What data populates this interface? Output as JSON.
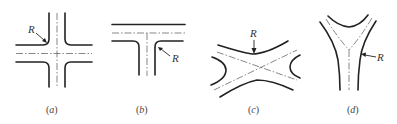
{
  "figure": {
    "panels": [
      {
        "id": "a",
        "caption": "(a)",
        "caption_letter": "a",
        "type": "four-way cross intersection",
        "radius_label": "R"
      },
      {
        "id": "b",
        "caption": "(b)",
        "caption_letter": "b",
        "type": "T intersection",
        "radius_label": "R"
      },
      {
        "id": "c",
        "caption": "(c)",
        "caption_letter": "c",
        "type": "X (skewed) intersection",
        "radius_label": "R"
      },
      {
        "id": "d",
        "caption": "(d)",
        "caption_letter": "d",
        "type": "Y intersection",
        "radius_label": "R"
      }
    ],
    "colors": {
      "line": "#222222",
      "centerline": "#555555",
      "background": "#ffffff"
    }
  }
}
